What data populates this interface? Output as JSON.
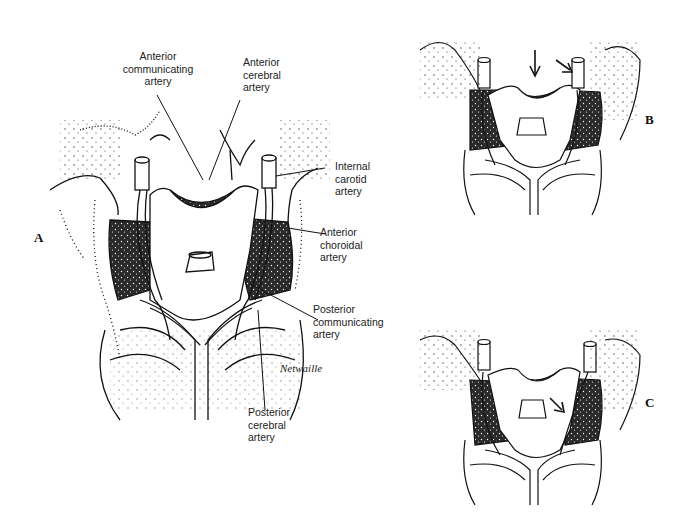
{
  "figure": {
    "panels": [
      {
        "id": "A",
        "letter": "A"
      },
      {
        "id": "B",
        "letter": "B"
      },
      {
        "id": "C",
        "letter": "C"
      }
    ],
    "labels": {
      "anterior_communicating": [
        "Anterior",
        "communicating",
        "artery"
      ],
      "anterior_cerebral": [
        "Anterior",
        "cerebral",
        "artery"
      ],
      "internal_carotid": [
        "Internal",
        "carotid",
        "artery"
      ],
      "anterior_choroidal": [
        "Anterior",
        "choroidal",
        "artery"
      ],
      "posterior_communicating": [
        "Posterior",
        "communicating",
        "artery"
      ],
      "posterior_cerebral": [
        "Posterior",
        "cerebral",
        "artery"
      ]
    },
    "signature": "Netwaille"
  }
}
